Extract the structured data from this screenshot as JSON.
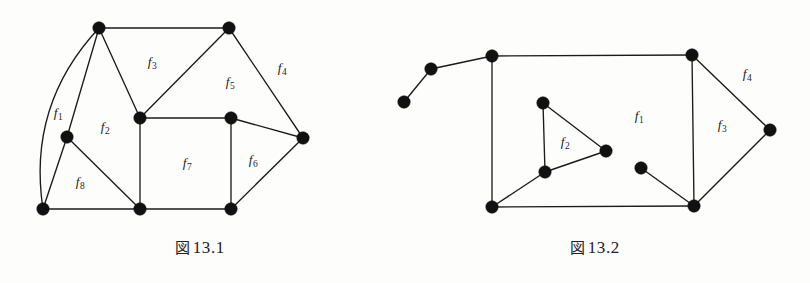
{
  "page": {
    "background_color": "#fdfdfc",
    "ink_color": "#1b1b1b",
    "width": 810,
    "height": 283
  },
  "figures": [
    {
      "id": "figure-1",
      "caption_kanji": "図",
      "caption_number": "13.1",
      "caption_full": "図 13.1",
      "vertices": [
        {
          "name": "v-top-left",
          "x": 99,
          "y": 28
        },
        {
          "name": "v-top-right",
          "x": 229,
          "y": 28
        },
        {
          "name": "v-left-mid",
          "x": 67,
          "y": 137
        },
        {
          "name": "v-center",
          "x": 140,
          "y": 118
        },
        {
          "name": "v-right-mid",
          "x": 231,
          "y": 118
        },
        {
          "name": "v-far-right",
          "x": 303,
          "y": 138
        },
        {
          "name": "v-bottom-left",
          "x": 43,
          "y": 209
        },
        {
          "name": "v-bottom-mid",
          "x": 140,
          "y": 209
        },
        {
          "name": "v-bottom-right",
          "x": 231,
          "y": 209
        }
      ],
      "edges": [
        {
          "from": "v-top-left",
          "to": "v-top-right"
        },
        {
          "from": "v-top-left",
          "to": "v-left-mid"
        },
        {
          "from": "v-top-left",
          "to": "v-center"
        },
        {
          "from": "v-top-right",
          "to": "v-center"
        },
        {
          "from": "v-top-right",
          "to": "v-far-right"
        },
        {
          "from": "v-center",
          "to": "v-right-mid"
        },
        {
          "from": "v-center",
          "to": "v-bottom-mid"
        },
        {
          "from": "v-right-mid",
          "to": "v-far-right"
        },
        {
          "from": "v-right-mid",
          "to": "v-bottom-right"
        },
        {
          "from": "v-far-right",
          "to": "v-bottom-right"
        },
        {
          "from": "v-left-mid",
          "to": "v-bottom-left"
        },
        {
          "from": "v-left-mid",
          "to": "v-bottom-mid"
        },
        {
          "from": "v-bottom-left",
          "to": "v-bottom-mid"
        },
        {
          "from": "v-bottom-mid",
          "to": "v-bottom-right"
        }
      ],
      "curved_edges": [
        {
          "name": "arc-topleft-to-bottomleft",
          "from": "v-top-left",
          "to": "v-bottom-left",
          "bow": "left"
        }
      ],
      "face_labels": [
        {
          "text": "f",
          "sub": "1",
          "x": 58,
          "y": 113
        },
        {
          "text": "f",
          "sub": "2",
          "x": 105,
          "y": 127
        },
        {
          "text": "f",
          "sub": "3",
          "x": 152,
          "y": 62
        },
        {
          "text": "f",
          "sub": "4",
          "x": 282,
          "y": 68
        },
        {
          "text": "f",
          "sub": "5",
          "x": 230,
          "y": 82
        },
        {
          "text": "f",
          "sub": "6",
          "x": 253,
          "y": 160
        },
        {
          "text": "f",
          "sub": "7",
          "x": 187,
          "y": 163
        },
        {
          "text": "f",
          "sub": "8",
          "x": 80,
          "y": 182
        }
      ]
    },
    {
      "id": "figure-2",
      "caption_kanji": "図",
      "caption_number": "13.2",
      "caption_full": "図 13.2",
      "vertices": [
        {
          "name": "v-tail-end",
          "x": 24,
          "y": 102
        },
        {
          "name": "v-tail-mid",
          "x": 51,
          "y": 69
        },
        {
          "name": "v-top-left",
          "x": 112,
          "y": 56
        },
        {
          "name": "v-top-right",
          "x": 312,
          "y": 55
        },
        {
          "name": "v-far-right",
          "x": 390,
          "y": 130
        },
        {
          "name": "v-tri-top",
          "x": 163,
          "y": 103
        },
        {
          "name": "v-tri-right",
          "x": 226,
          "y": 151
        },
        {
          "name": "v-tri-bottom",
          "x": 165,
          "y": 172
        },
        {
          "name": "v-inner-isolated",
          "x": 261,
          "y": 168
        },
        {
          "name": "v-bottom-left",
          "x": 112,
          "y": 207
        },
        {
          "name": "v-bottom-right",
          "x": 314,
          "y": 206
        }
      ],
      "edges": [
        {
          "from": "v-tail-end",
          "to": "v-tail-mid"
        },
        {
          "from": "v-tail-mid",
          "to": "v-top-left"
        },
        {
          "from": "v-top-left",
          "to": "v-top-right"
        },
        {
          "from": "v-top-left",
          "to": "v-bottom-left"
        },
        {
          "from": "v-top-right",
          "to": "v-bottom-right"
        },
        {
          "from": "v-top-right",
          "to": "v-far-right"
        },
        {
          "from": "v-far-right",
          "to": "v-bottom-right"
        },
        {
          "from": "v-bottom-left",
          "to": "v-bottom-right"
        },
        {
          "from": "v-bottom-left",
          "to": "v-tri-bottom"
        },
        {
          "from": "v-tri-bottom",
          "to": "v-tri-top"
        },
        {
          "from": "v-tri-top",
          "to": "v-tri-right"
        },
        {
          "from": "v-tri-right",
          "to": "v-tri-bottom"
        },
        {
          "from": "v-inner-isolated",
          "to": "v-bottom-right"
        }
      ],
      "curved_edges": [],
      "face_labels": [
        {
          "text": "f",
          "sub": "1",
          "x": 259,
          "y": 116
        },
        {
          "text": "f",
          "sub": "2",
          "x": 185,
          "y": 142
        },
        {
          "text": "f",
          "sub": "3",
          "x": 342,
          "y": 125
        },
        {
          "text": "f",
          "sub": "4",
          "x": 367,
          "y": 74
        }
      ]
    }
  ]
}
